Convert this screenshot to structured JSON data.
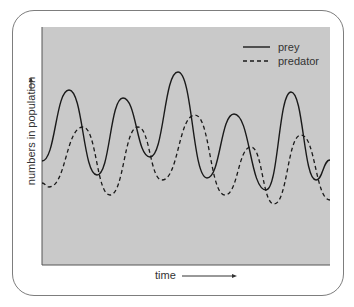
{
  "chart_data": {
    "type": "line",
    "title": "",
    "xlabel": "time",
    "ylabel": "numbers in population",
    "x_arrow": true,
    "y_arrow": true,
    "grid": false,
    "legend_position": "top-right",
    "plot_background": "#c9c9c9",
    "x": [
      0,
      1,
      2,
      3,
      4,
      5,
      6,
      7,
      8,
      9,
      10,
      11,
      12
    ],
    "series": [
      {
        "name": "prey",
        "style": "solid",
        "color": "#1a1a1a",
        "points_px": [
          [
            42,
            161
          ],
          [
            69,
            90
          ],
          [
            97,
            175
          ],
          [
            123,
            98
          ],
          [
            150,
            157
          ],
          [
            178,
            72
          ],
          [
            207,
            178
          ],
          [
            234,
            114
          ],
          [
            266,
            190
          ],
          [
            291,
            92
          ],
          [
            316,
            180
          ],
          [
            330,
            160
          ]
        ],
        "description": "oscillating; peaks lead predator peaks"
      },
      {
        "name": "predator",
        "style": "dashed",
        "color": "#1a1a1a",
        "points_px": [
          [
            42,
            183
          ],
          [
            49,
            187
          ],
          [
            83,
            127
          ],
          [
            110,
            195
          ],
          [
            138,
            127
          ],
          [
            162,
            180
          ],
          [
            195,
            115
          ],
          [
            225,
            195
          ],
          [
            251,
            147
          ],
          [
            274,
            204
          ],
          [
            301,
            135
          ],
          [
            330,
            200
          ]
        ],
        "description": "oscillating; lags prey by a quarter cycle, lower amplitude"
      }
    ]
  },
  "legend": {
    "items": [
      {
        "label": "prey",
        "style": "solid"
      },
      {
        "label": "predator",
        "style": "dashed"
      }
    ]
  },
  "axes": {
    "x_label": "time",
    "y_label": "numbers in population"
  }
}
